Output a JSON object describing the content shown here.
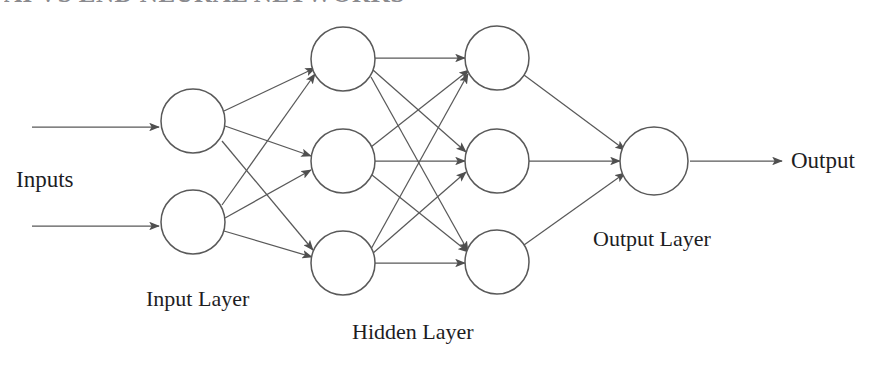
{
  "diagram": {
    "type": "neural-network-architecture",
    "title_partial": "AI VS END NEURAL NETWORKS",
    "background_color": "#ffffff",
    "stroke_color": "#595959",
    "node_fill": "#ffffff",
    "text_color": "#1d1d1f",
    "labels": {
      "inputs": "Inputs",
      "input_layer": "Input Layer",
      "hidden_layer": "Hidden Layer",
      "output_layer": "Output Layer",
      "output": "Output"
    },
    "layers": [
      {
        "name": "input-layer",
        "label": "Input Layer",
        "node_count": 2,
        "center_x": 193,
        "radius": 32,
        "nodes": [
          {
            "id": "in-1",
            "cx": 193,
            "cy": 121
          },
          {
            "id": "in-2",
            "cx": 193,
            "cy": 222
          }
        ]
      },
      {
        "name": "hidden-layer-1",
        "label": "Hidden Layer",
        "node_count": 3,
        "center_x": 343,
        "radius": 32,
        "nodes": [
          {
            "id": "h1-1",
            "cx": 343,
            "cy": 59
          },
          {
            "id": "h1-2",
            "cx": 343,
            "cy": 161
          },
          {
            "id": "h1-3",
            "cx": 343,
            "cy": 263
          }
        ]
      },
      {
        "name": "hidden-layer-2",
        "label": "Hidden Layer",
        "node_count": 3,
        "center_x": 497,
        "radius": 32,
        "nodes": [
          {
            "id": "h2-1",
            "cx": 497,
            "cy": 58
          },
          {
            "id": "h2-2",
            "cx": 497,
            "cy": 161
          },
          {
            "id": "h2-3",
            "cx": 497,
            "cy": 262
          }
        ]
      },
      {
        "name": "output-layer",
        "label": "Output Layer",
        "node_count": 1,
        "center_x": 654,
        "radius": 34,
        "nodes": [
          {
            "id": "out-1",
            "cx": 654,
            "cy": 161
          }
        ]
      }
    ],
    "input_arrows": [
      {
        "id": "input-arrow-1",
        "x1": 32,
        "y1": 127,
        "x2": 159,
        "y2": 127
      },
      {
        "id": "input-arrow-2",
        "x1": 32,
        "y1": 226,
        "x2": 159,
        "y2": 226
      }
    ],
    "output_arrow": {
      "id": "output-arrow",
      "x1": 690,
      "y1": 161,
      "x2": 782,
      "y2": 161
    },
    "connection_counts": {
      "input_to_hidden1": 6,
      "hidden1_to_hidden2": 9,
      "hidden2_to_output": 3,
      "total_edges": 18
    },
    "edges": [
      {
        "from": "in-1",
        "to": "h1-1"
      },
      {
        "from": "in-1",
        "to": "h1-2"
      },
      {
        "from": "in-1",
        "to": "h1-3"
      },
      {
        "from": "in-2",
        "to": "h1-1"
      },
      {
        "from": "in-2",
        "to": "h1-2"
      },
      {
        "from": "in-2",
        "to": "h1-3"
      },
      {
        "from": "h1-1",
        "to": "h2-1"
      },
      {
        "from": "h1-1",
        "to": "h2-2"
      },
      {
        "from": "h1-1",
        "to": "h2-3"
      },
      {
        "from": "h1-2",
        "to": "h2-1"
      },
      {
        "from": "h1-2",
        "to": "h2-2"
      },
      {
        "from": "h1-2",
        "to": "h2-3"
      },
      {
        "from": "h1-3",
        "to": "h2-1"
      },
      {
        "from": "h1-3",
        "to": "h2-2"
      },
      {
        "from": "h1-3",
        "to": "h2-3"
      },
      {
        "from": "h2-1",
        "to": "out-1"
      },
      {
        "from": "h2-2",
        "to": "out-1"
      },
      {
        "from": "h2-3",
        "to": "out-1"
      }
    ]
  }
}
